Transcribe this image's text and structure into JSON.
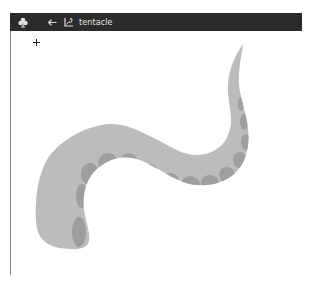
{
  "window": {
    "title": "tentacle",
    "icons": {
      "app": "club-icon",
      "back": "back-arrow-icon",
      "document": "image-chart-icon"
    },
    "colors": {
      "titlebar": "#2b2b2b",
      "title_text": "#e6e6e6",
      "canvas": "#ffffff"
    }
  },
  "canvas": {
    "cursor": "crosshair",
    "drawing": {
      "subject": "tentacle",
      "body_color": "#bcbcbc",
      "sucker_color": "#9e9e9e"
    }
  }
}
